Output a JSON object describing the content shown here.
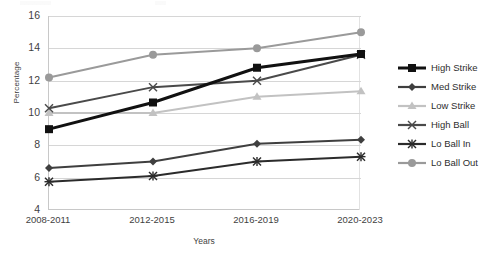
{
  "chart_data": {
    "type": "line",
    "title": "",
    "xlabel": "Years",
    "ylabel": "Percentage",
    "categories": [
      "2008-2011",
      "2012-2015",
      "2016-2019",
      "2020-2023"
    ],
    "ylim": [
      4,
      16
    ],
    "yticks": [
      4,
      6,
      8,
      10,
      12,
      14,
      16
    ],
    "grid": true,
    "legend_position": "right",
    "series": [
      {
        "name": "High Strike",
        "values": [
          9.0,
          10.65,
          12.8,
          13.65
        ],
        "color": "#111111",
        "marker": "square"
      },
      {
        "name": "Med Strike",
        "values": [
          6.6,
          7.0,
          8.1,
          8.35
        ],
        "color": "#3f3f3f",
        "marker": "diamond"
      },
      {
        "name": "Low Strike",
        "values": [
          10.0,
          10.0,
          11.0,
          11.35
        ],
        "color": "#c2c2c2",
        "marker": "triangle"
      },
      {
        "name": "High Ball",
        "values": [
          10.3,
          11.6,
          12.0,
          13.6
        ],
        "color": "#4a4a4a",
        "marker": "x"
      },
      {
        "name": "Lo Ball In",
        "values": [
          5.75,
          6.1,
          7.0,
          7.3
        ],
        "color": "#2b2b2b",
        "marker": "star"
      },
      {
        "name": "Lo Ball Out",
        "values": [
          12.2,
          13.6,
          14.0,
          15.0
        ],
        "color": "#9a9a9a",
        "marker": "circle"
      }
    ]
  }
}
